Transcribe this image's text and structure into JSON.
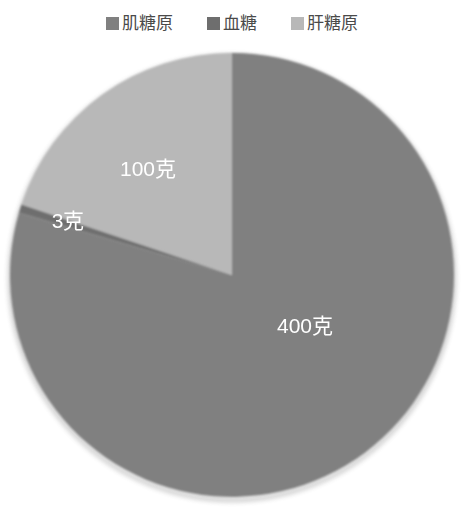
{
  "legend": {
    "position": "top",
    "entries": [
      {
        "label": "肌糖原",
        "color": "#808080",
        "swatch_icon": "square-swatch-icon"
      },
      {
        "label": "血糖",
        "color": "#6e6e6e",
        "swatch_icon": "square-swatch-icon"
      },
      {
        "label": "肝糖原",
        "color": "#b8b8b8",
        "swatch_icon": "square-swatch-icon"
      }
    ]
  },
  "chart_data": {
    "type": "pie",
    "title": "",
    "subtitle": "",
    "xlabel": "",
    "ylabel": "",
    "grid": false,
    "legend_position": "top",
    "unit": "克",
    "categories": [
      "肌糖原",
      "血糖",
      "肝糖原"
    ],
    "values": [
      400,
      3,
      100
    ],
    "colors": [
      "#808080",
      "#6e6e6e",
      "#b8b8b8"
    ],
    "total": 503,
    "slices": [
      {
        "name": "肌糖原",
        "value": 400,
        "label": "400克",
        "color": "#808080",
        "percent": 79.5,
        "start_angle_deg": 0,
        "end_angle_deg": 286.3,
        "label_x": 305,
        "label_y": 289
      },
      {
        "name": "血糖",
        "value": 3,
        "label": "3克",
        "color": "#6e6e6e",
        "percent": 0.6,
        "start_angle_deg": 286.3,
        "end_angle_deg": 288.5,
        "label_x": 68,
        "label_y": 184
      },
      {
        "name": "肝糖原",
        "value": 100,
        "label": "100克",
        "color": "#b8b8b8",
        "percent": 19.9,
        "start_angle_deg": 288.5,
        "end_angle_deg": 360,
        "label_x": 148,
        "label_y": 132
      }
    ],
    "geometry": {
      "center_x": 232,
      "center_y": 237,
      "radius": 222
    }
  }
}
